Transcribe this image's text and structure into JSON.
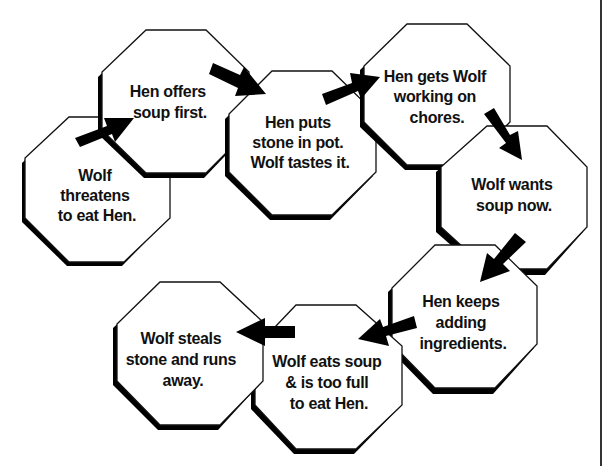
{
  "diagram": {
    "type": "sequence-chain",
    "title": "",
    "colors": {
      "stroke": "#111111",
      "fill": "#ffffff",
      "arrow": "#000000",
      "text": "#111111"
    },
    "nodes": [
      {
        "id": "n1",
        "lines": [
          "Wolf",
          "threatens",
          "to eat Hen."
        ]
      },
      {
        "id": "n2",
        "lines": [
          "Hen offers",
          "soup first."
        ]
      },
      {
        "id": "n3",
        "lines": [
          "Hen puts",
          "stone in pot.",
          "Wolf tastes it."
        ]
      },
      {
        "id": "n4",
        "lines": [
          "Hen gets Wolf",
          "working on",
          "chores."
        ]
      },
      {
        "id": "n5",
        "lines": [
          "Wolf wants",
          "soup now."
        ]
      },
      {
        "id": "n6",
        "lines": [
          "Hen keeps",
          "adding",
          "ingredients."
        ]
      },
      {
        "id": "n7",
        "lines": [
          "Wolf eats soup",
          "& is too full",
          "to eat Hen."
        ]
      },
      {
        "id": "n8",
        "lines": [
          "Wolf steals",
          "stone and runs",
          "away."
        ]
      }
    ],
    "edges": [
      {
        "from": "n1",
        "to": "n2"
      },
      {
        "from": "n2",
        "to": "n3"
      },
      {
        "from": "n3",
        "to": "n4"
      },
      {
        "from": "n4",
        "to": "n5"
      },
      {
        "from": "n5",
        "to": "n6"
      },
      {
        "from": "n6",
        "to": "n7"
      },
      {
        "from": "n7",
        "to": "n8"
      }
    ]
  }
}
